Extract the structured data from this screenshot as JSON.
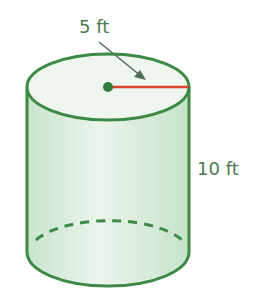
{
  "diagram": {
    "shape": "cylinder",
    "labels": {
      "radius": "5 ft",
      "height": "10 ft"
    },
    "colors": {
      "outline": "#3d8a45",
      "fill_side": "#d6ecd9",
      "fill_top": "#eef6ef",
      "radius_line": "#d9442c",
      "center_dot": "#2f7d38",
      "arrow": "#4f6e55",
      "label_text": "#4c7a52"
    }
  }
}
